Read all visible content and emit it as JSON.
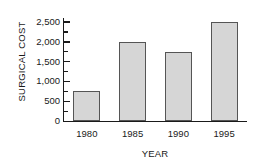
{
  "chart_data": {
    "type": "bar",
    "title": "",
    "categories": [
      "1980",
      "1985",
      "1990",
      "1995"
    ],
    "values": [
      750,
      2000,
      1750,
      2500
    ],
    "xlabel": "YEAR",
    "ylabel": "SURGICAL COST",
    "ylim": [
      0,
      2600
    ],
    "y_ticks": [
      0,
      500,
      1000,
      1500,
      2000,
      2500
    ],
    "y_tick_labels": [
      "0",
      "500",
      "1,000",
      "1,500",
      "2,000",
      "2,500"
    ],
    "y_minor_ticks": [
      250,
      750,
      1250,
      1750,
      2250
    ],
    "grid": false,
    "legend": null,
    "bar_fill_color": "#d6d6d6",
    "bar_border_color": "#555555",
    "axis_color": "#1a1a1a",
    "background_color": "#ffffff"
  }
}
